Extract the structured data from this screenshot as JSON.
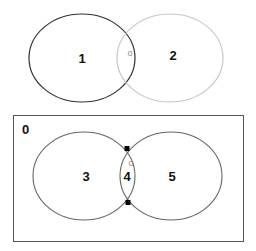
{
  "top_diagram": {
    "left_region_label": "1",
    "right_region_label": "2",
    "intersection_marker": "o",
    "left_circle_color": "#333333",
    "right_circle_color": "#c8c8c8"
  },
  "bottom_diagram": {
    "universe_label": "0",
    "left_region_label": "3",
    "intersection_label": "4",
    "right_region_label": "5",
    "intersection_marker": "o",
    "stroke_color": "#666666",
    "point_color": "#000000"
  }
}
